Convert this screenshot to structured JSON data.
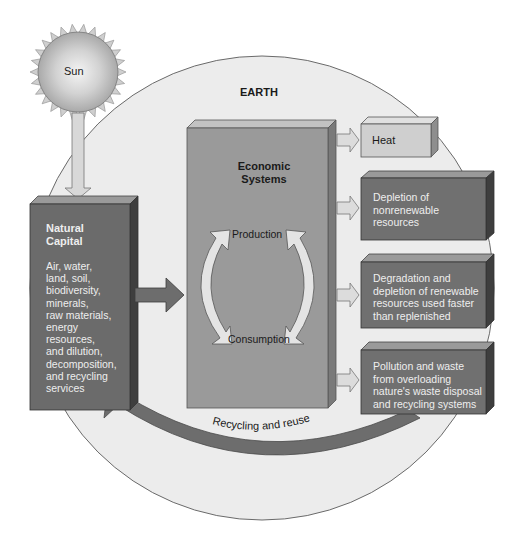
{
  "diagram": {
    "type": "flow",
    "colors": {
      "earth_fill": "#ececec",
      "earth_stroke": "#6a6a6a",
      "natural_capital_box": "#6b6b6b",
      "economic_box": "#9a9a9a",
      "heat_box": "#cfcfcf",
      "output_box": "#707070",
      "arrow_light": "#dcdcdc",
      "arrow_dark": "#6d6d6d",
      "sun": "#bdbdbd"
    },
    "sun": {
      "label": "Sun"
    },
    "earth": {
      "label": "EARTH"
    },
    "natural_capital": {
      "title": "Natural\nCapital",
      "title_line1": "Natural",
      "title_line2": "Capital",
      "items": [
        "Air, water,",
        "land, soil,",
        "biodiversity,",
        "minerals,",
        "raw materials,",
        "energy",
        "resources,",
        "and dilution,",
        "decomposition,",
        "and recycling",
        "services"
      ]
    },
    "economic_systems": {
      "title_line1": "Economic",
      "title_line2": "Systems",
      "cycle": {
        "top": "Production",
        "bottom": "Consumption"
      }
    },
    "outputs": [
      {
        "lines": [
          "Heat"
        ]
      },
      {
        "lines": [
          "Depletion of",
          "nonrenewable",
          "resources"
        ]
      },
      {
        "lines": [
          "Degradation and",
          "depletion of renewable",
          "resources used faster",
          "than replenished"
        ]
      },
      {
        "lines": [
          "Pollution and waste",
          "from overloading",
          "nature's waste disposal",
          "and recycling systems"
        ]
      }
    ],
    "feedback": {
      "label": "Recycling and reuse"
    },
    "edges": [
      {
        "from": "Sun",
        "to": "Natural Capital"
      },
      {
        "from": "Natural Capital",
        "to": "Economic Systems"
      },
      {
        "from": "Economic Systems",
        "to": "Heat"
      },
      {
        "from": "Economic Systems",
        "to": "Depletion of nonrenewable resources"
      },
      {
        "from": "Economic Systems",
        "to": "Degradation and depletion of renewable resources"
      },
      {
        "from": "Economic Systems",
        "to": "Pollution and waste"
      },
      {
        "from": "Production",
        "to": "Consumption",
        "bidirectional": true
      },
      {
        "from": "Pollution and waste",
        "to": "Natural Capital",
        "label": "Recycling and reuse"
      }
    ]
  }
}
